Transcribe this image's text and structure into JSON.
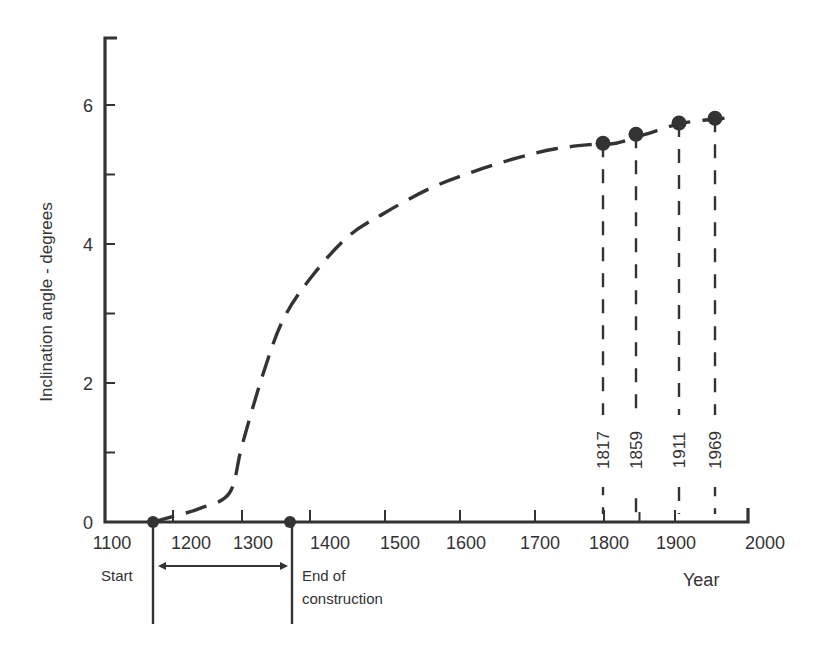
{
  "chart_data": {
    "type": "line",
    "title": "",
    "xlabel": "Year",
    "ylabel": "Inclination angle - degrees",
    "xlim": [
      1100,
      2000
    ],
    "ylim": [
      0,
      6.6
    ],
    "x_tick_labels": [
      "1100",
      "1200",
      "1300",
      "1400",
      "1500",
      "1600",
      "1700",
      "1800",
      "1900",
      "2000"
    ],
    "y_tick_labels": [
      "0",
      "2",
      "4",
      "6"
    ],
    "y_minor_ticks": [
      1,
      3,
      5
    ],
    "grid": false,
    "legend": null,
    "series": [
      {
        "name": "Inclination (estimated trend)",
        "style": "dashed",
        "x": [
          1173,
          1200,
          1240,
          1282,
          1300,
          1330,
          1360,
          1400,
          1450,
          1500,
          1560,
          1620,
          1680,
          1730,
          1780,
          1817,
          1859,
          1911,
          1969
        ],
        "y": [
          0.0,
          0.08,
          0.2,
          0.42,
          1.1,
          2.1,
          2.9,
          3.5,
          4.1,
          4.45,
          4.8,
          5.05,
          5.25,
          5.37,
          5.43,
          5.45,
          5.58,
          5.74,
          5.81
        ]
      }
    ],
    "measured_points": [
      {
        "year": 1817,
        "angle": 5.45,
        "label": "1817"
      },
      {
        "year": 1859,
        "angle": 5.58,
        "label": "1859"
      },
      {
        "year": 1911,
        "angle": 5.74,
        "label": "1911"
      },
      {
        "year": 1969,
        "angle": 5.81,
        "label": "1969"
      }
    ],
    "annotations": [
      {
        "text": "Start",
        "year": 1173,
        "marker": "dot on x-axis"
      },
      {
        "text": "End of construction",
        "year": 1370,
        "marker": "dot on x-axis"
      },
      {
        "text": "construction period",
        "type": "double-arrow",
        "from": 1173,
        "to": 1370
      }
    ]
  },
  "labels": {
    "ylabel": "Inclination angle - degrees",
    "xlabel": "Year",
    "start": "Start",
    "end_line1": "End of",
    "end_line2": "construction"
  }
}
